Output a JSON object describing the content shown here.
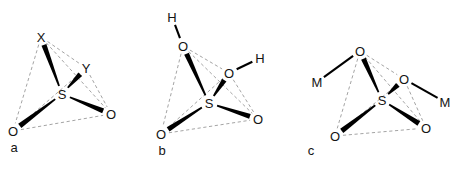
{
  "figure": {
    "background_color": "#ffffff",
    "bond_color": "#000000",
    "edge_color": "#9a9a9a",
    "text_color": "#141414",
    "panels": [
      {
        "id": "a",
        "label": "a",
        "label_pos": [
          14,
          152
        ],
        "center_atom": {
          "name": "S",
          "label": "S",
          "pos": [
            62,
            94
          ]
        },
        "vertices": [
          {
            "name": "X",
            "label": "X",
            "pos": [
              41,
              37
            ]
          },
          {
            "name": "Y",
            "label": "Y",
            "pos": [
              86,
              68
            ]
          },
          {
            "name": "O-left",
            "label": "O",
            "pos": [
              13,
              131
            ]
          },
          {
            "name": "O-right",
            "label": "O",
            "pos": [
              111,
              114
            ]
          }
        ],
        "substituents": [],
        "bonds": [
          {
            "from": "S",
            "to": "X",
            "style": "wedge"
          },
          {
            "from": "S",
            "to": "Y",
            "style": "wedge"
          },
          {
            "from": "S",
            "to": "O-left",
            "style": "wedge"
          },
          {
            "from": "S",
            "to": "O-right",
            "style": "wedge"
          }
        ],
        "edges": [
          [
            "X",
            "Y"
          ],
          [
            "X",
            "O-left"
          ],
          [
            "X",
            "O-right"
          ],
          [
            "Y",
            "O-left"
          ],
          [
            "Y",
            "O-right"
          ],
          [
            "O-left",
            "O-right"
          ]
        ]
      },
      {
        "id": "b",
        "label": "b",
        "label_pos": [
          162,
          155
        ],
        "center_atom": {
          "name": "S",
          "label": "S",
          "pos": [
            209,
            103
          ]
        },
        "vertices": [
          {
            "name": "O-top",
            "label": "O",
            "pos": [
              183,
              46
            ]
          },
          {
            "name": "O-mid",
            "label": "O",
            "pos": [
              229,
              73
            ]
          },
          {
            "name": "O-left",
            "label": "O",
            "pos": [
              161,
              134
            ]
          },
          {
            "name": "O-right",
            "label": "O",
            "pos": [
              258,
              119
            ]
          }
        ],
        "substituents": [
          {
            "name": "H-top",
            "label": "H",
            "pos": [
              172,
              17
            ],
            "bonded_to": "O-top"
          },
          {
            "name": "H-right",
            "label": "H",
            "pos": [
              260,
              58
            ],
            "bonded_to": "O-mid"
          }
        ],
        "bonds": [
          {
            "from": "S",
            "to": "O-top",
            "style": "wedge"
          },
          {
            "from": "S",
            "to": "O-mid",
            "style": "wedge"
          },
          {
            "from": "S",
            "to": "O-left",
            "style": "wedge"
          },
          {
            "from": "S",
            "to": "O-right",
            "style": "wedge"
          }
        ],
        "edges": [
          [
            "O-top",
            "O-mid"
          ],
          [
            "O-top",
            "O-left"
          ],
          [
            "O-top",
            "O-right"
          ],
          [
            "O-mid",
            "O-left"
          ],
          [
            "O-mid",
            "O-right"
          ],
          [
            "O-left",
            "O-right"
          ]
        ]
      },
      {
        "id": "c",
        "label": "c",
        "label_pos": [
          311,
          155
        ],
        "center_atom": {
          "name": "S",
          "label": "S",
          "pos": [
            382,
            100
          ]
        },
        "vertices": [
          {
            "name": "O-top",
            "label": "O",
            "pos": [
              360,
              51
            ]
          },
          {
            "name": "O-mid",
            "label": "O",
            "pos": [
              404,
              79
            ]
          },
          {
            "name": "O-left",
            "label": "O",
            "pos": [
              335,
              136
            ]
          },
          {
            "name": "O-right",
            "label": "O",
            "pos": [
              426,
              128
            ]
          }
        ],
        "substituents": [
          {
            "name": "M-left",
            "label": "M",
            "pos": [
              317,
              82
            ],
            "bonded_to": "O-top"
          },
          {
            "name": "M-right",
            "label": "M",
            "pos": [
              445,
              102
            ],
            "bonded_to": "O-mid"
          }
        ],
        "bonds": [
          {
            "from": "S",
            "to": "O-top",
            "style": "wedge"
          },
          {
            "from": "S",
            "to": "O-mid",
            "style": "wedge"
          },
          {
            "from": "S",
            "to": "O-left",
            "style": "wedge"
          },
          {
            "from": "S",
            "to": "O-right",
            "style": "wedge"
          }
        ],
        "edges": [
          [
            "O-top",
            "O-mid"
          ],
          [
            "O-top",
            "O-left"
          ],
          [
            "O-top",
            "O-right"
          ],
          [
            "O-mid",
            "O-left"
          ],
          [
            "O-mid",
            "O-right"
          ],
          [
            "O-left",
            "O-right"
          ]
        ]
      }
    ]
  }
}
